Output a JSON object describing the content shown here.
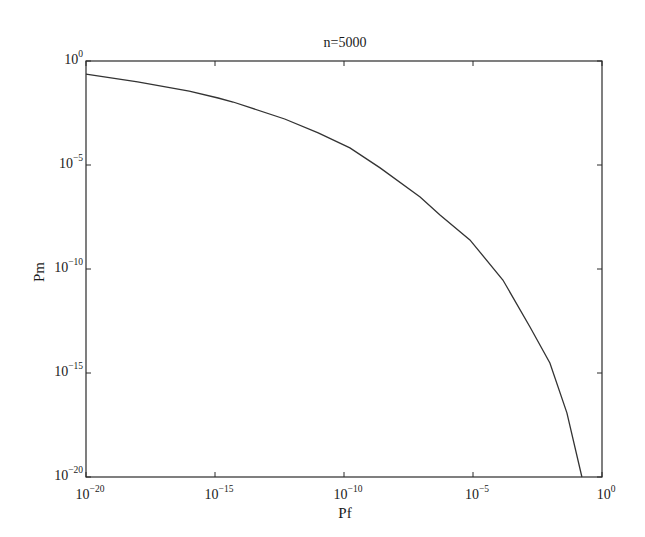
{
  "chart_data": {
    "type": "line",
    "title": "n=5000",
    "xlabel": "Pf",
    "ylabel": "Pm",
    "xscale": "log",
    "yscale": "log",
    "xlim_exp": [
      -20,
      0
    ],
    "ylim_exp": [
      -20,
      0
    ],
    "xticks": [
      {
        "base": "10",
        "exp": "-20",
        "value": -20
      },
      {
        "base": "10",
        "exp": "-15",
        "value": -15
      },
      {
        "base": "10",
        "exp": "-10",
        "value": -10
      },
      {
        "base": "10",
        "exp": "-5",
        "value": -5
      },
      {
        "base": "10",
        "exp": "0",
        "value": 0
      }
    ],
    "yticks": [
      {
        "base": "10",
        "exp": "0",
        "value": 0
      },
      {
        "base": "10",
        "exp": "-5",
        "value": -5
      },
      {
        "base": "10",
        "exp": "-10",
        "value": -10
      },
      {
        "base": "10",
        "exp": "-15",
        "value": -15
      },
      {
        "base": "10",
        "exp": "-20",
        "value": -20
      }
    ],
    "grid": false,
    "legend": null,
    "series": [
      {
        "name": "n=5000",
        "color": "#333333",
        "log10_x": [
          -20.0,
          -18.0,
          -16.0,
          -14.88,
          -14.3,
          -12.3,
          -11.0,
          -9.77,
          -8.6,
          -7.05,
          -6.28,
          -5.12,
          -3.84,
          -2.79,
          -2.02,
          -1.36,
          -0.78
        ],
        "log10_y": [
          -0.63,
          -1.0,
          -1.45,
          -1.78,
          -1.97,
          -2.79,
          -3.45,
          -4.18,
          -5.14,
          -6.54,
          -7.4,
          -8.6,
          -10.53,
          -12.79,
          -14.52,
          -16.92,
          -20.0
        ]
      }
    ]
  }
}
